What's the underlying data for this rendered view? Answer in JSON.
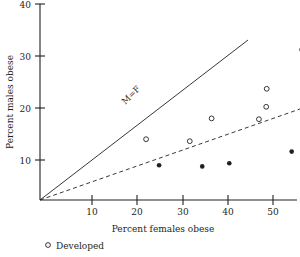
{
  "chart_data": {
    "type": "scatter",
    "title": "",
    "xlabel": "Percent females obese",
    "ylabel": "Percent males obese",
    "xlim": [
      0,
      55
    ],
    "ylim": [
      0,
      40
    ],
    "xticks": [
      10,
      20,
      30,
      40,
      50
    ],
    "yticks": [
      10,
      20,
      30,
      40
    ],
    "grid": false,
    "legend_position": "below-left",
    "series": [
      {
        "name": "Developed",
        "marker": "open-circle",
        "points": [
          {
            "x": 20.4,
            "y": 15.2
          },
          {
            "x": 28.8,
            "y": 14.7
          },
          {
            "x": 33.0,
            "y": 20.4
          },
          {
            "x": 42.1,
            "y": 20.2
          },
          {
            "x": 43.5,
            "y": 23.3
          },
          {
            "x": 43.6,
            "y": 27.8
          },
          {
            "x": 50.4,
            "y": 37.6
          }
        ]
      },
      {
        "name": "",
        "marker": "filled-circle",
        "points": [
          {
            "x": 22.9,
            "y": 8.7
          },
          {
            "x": 31.2,
            "y": 8.4
          },
          {
            "x": 36.4,
            "y": 9.2
          },
          {
            "x": 48.4,
            "y": 12.1
          },
          {
            "x": 50.5,
            "y": 14.0
          },
          {
            "x": 50.5,
            "y": 8.3
          }
        ]
      }
    ],
    "reference_lines": [
      {
        "name": "M=F",
        "label": "M=F",
        "style": "solid",
        "slope": 1,
        "intercept": 0,
        "x_end": 40
      },
      {
        "name": "half-line",
        "label": "",
        "style": "dashed",
        "slope": 0.455,
        "intercept": 0,
        "x_end": 55
      }
    ]
  },
  "legend": {
    "entries": [
      {
        "marker": "open-circle",
        "label": "Developed"
      }
    ]
  },
  "axes": {
    "x_title": "Percent females obese",
    "y_title": "Percent males obese",
    "x_tick_labels": [
      "10",
      "20",
      "30",
      "40",
      "50"
    ],
    "y_tick_labels": [
      "10",
      "20",
      "30",
      "40"
    ]
  },
  "annotations": {
    "reference_line_label": "M=F"
  },
  "colors": {
    "ink": "#231f20",
    "background": "#ffffff"
  }
}
